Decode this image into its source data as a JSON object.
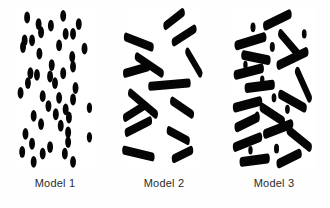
{
  "figure": {
    "background_color": "#fefefe",
    "panel_background_color": "#ffffff",
    "shape_color": "#050505",
    "label_color": "#2b2b2b"
  },
  "panels": [
    {
      "id": "model-1",
      "label": "Model 1",
      "shape_type": "circle",
      "description": "Randomly dispersed spherical particles (dots)"
    },
    {
      "id": "model-2",
      "label": "Model 2",
      "shape_type": "rod",
      "description": "Randomly oriented elongated rods, sparse"
    },
    {
      "id": "model-3",
      "label": "Model 3",
      "shape_type": "rod-and-circle",
      "description": "Dense mixture of rods and small particles"
    }
  ],
  "chart_data": {
    "type": "scatter",
    "title": "",
    "xlabel": "",
    "ylabel": "",
    "panel_width": 100,
    "panel_height": 100,
    "panel_1_circles": [
      {
        "cx": 16,
        "cy": 7,
        "r": 3.6
      },
      {
        "cx": 60,
        "cy": 6,
        "r": 3.6
      },
      {
        "cx": 30,
        "cy": 11,
        "r": 3.6
      },
      {
        "cx": 45,
        "cy": 12,
        "r": 3.6
      },
      {
        "cx": 79,
        "cy": 11,
        "r": 3.6
      },
      {
        "cx": 33,
        "cy": 16,
        "r": 3.6
      },
      {
        "cx": 63,
        "cy": 17,
        "r": 3.6
      },
      {
        "cx": 72,
        "cy": 17,
        "r": 3.6
      },
      {
        "cx": 13,
        "cy": 21,
        "r": 3.6
      },
      {
        "cx": 22,
        "cy": 21,
        "r": 3.6
      },
      {
        "cx": 55,
        "cy": 24,
        "r": 3.6
      },
      {
        "cx": 11,
        "cy": 25,
        "r": 3.6
      },
      {
        "cx": 31,
        "cy": 29,
        "r": 3.6
      },
      {
        "cx": 86,
        "cy": 26,
        "r": 3.6
      },
      {
        "cx": 71,
        "cy": 31,
        "r": 3.6
      },
      {
        "cx": 72,
        "cy": 37,
        "r": 3.6
      },
      {
        "cx": 46,
        "cy": 36,
        "r": 3.6
      },
      {
        "cx": 20,
        "cy": 41,
        "r": 3.6
      },
      {
        "cx": 28,
        "cy": 42,
        "r": 3.6
      },
      {
        "cx": 44,
        "cy": 43,
        "r": 3.6
      },
      {
        "cx": 60,
        "cy": 41,
        "r": 3.6
      },
      {
        "cx": 17,
        "cy": 47,
        "r": 3.6
      },
      {
        "cx": 50,
        "cy": 47,
        "r": 3.6
      },
      {
        "cx": 8,
        "cy": 53,
        "r": 3.6
      },
      {
        "cx": 75,
        "cy": 50,
        "r": 3.6
      },
      {
        "cx": 35,
        "cy": 55,
        "r": 3.6
      },
      {
        "cx": 55,
        "cy": 56,
        "r": 3.6
      },
      {
        "cx": 72,
        "cy": 57,
        "r": 3.6
      },
      {
        "cx": 42,
        "cy": 61,
        "r": 3.6
      },
      {
        "cx": 63,
        "cy": 63,
        "r": 3.6
      },
      {
        "cx": 92,
        "cy": 62,
        "r": 3.2
      },
      {
        "cx": 24,
        "cy": 67,
        "r": 3.6
      },
      {
        "cx": 51,
        "cy": 66,
        "r": 3.6
      },
      {
        "cx": 67,
        "cy": 68,
        "r": 3.6
      },
      {
        "cx": 33,
        "cy": 72,
        "r": 3.6
      },
      {
        "cx": 57,
        "cy": 73,
        "r": 3.6
      },
      {
        "cx": 14,
        "cy": 78,
        "r": 3.6
      },
      {
        "cx": 66,
        "cy": 77,
        "r": 3.6
      },
      {
        "cx": 66,
        "cy": 83,
        "r": 3.6
      },
      {
        "cx": 92,
        "cy": 80,
        "r": 3.2
      },
      {
        "cx": 22,
        "cy": 84,
        "r": 3.6
      },
      {
        "cx": 44,
        "cy": 86,
        "r": 3.6
      },
      {
        "cx": 10,
        "cy": 89,
        "r": 3.6
      },
      {
        "cx": 35,
        "cy": 90,
        "r": 3.6
      },
      {
        "cx": 62,
        "cy": 90,
        "r": 3.6
      },
      {
        "cx": 24,
        "cy": 95,
        "r": 3.6
      },
      {
        "cx": 72,
        "cy": 95,
        "r": 3.6
      }
    ],
    "panel_2_rods": [
      {
        "x1": 52,
        "y1": 12,
        "x2": 72,
        "y2": 4,
        "w": 5.5
      },
      {
        "x1": 5,
        "y1": 19,
        "x2": 35,
        "y2": 25,
        "w": 5.5
      },
      {
        "x1": 62,
        "y1": 22,
        "x2": 86,
        "y2": 14,
        "w": 5.5
      },
      {
        "x1": 18,
        "y1": 31,
        "x2": 47,
        "y2": 41,
        "w": 5.5
      },
      {
        "x1": 78,
        "y1": 28,
        "x2": 93,
        "y2": 41,
        "w": 5.5
      },
      {
        "x1": 4,
        "y1": 41,
        "x2": 31,
        "y2": 37,
        "w": 5.5
      },
      {
        "x1": 10,
        "y1": 53,
        "x2": 40,
        "y2": 66,
        "w": 5.5
      },
      {
        "x1": 34,
        "y1": 49,
        "x2": 79,
        "y2": 47,
        "w": 5.5
      },
      {
        "x1": 60,
        "y1": 58,
        "x2": 83,
        "y2": 66,
        "w": 5.5
      },
      {
        "x1": 4,
        "y1": 68,
        "x2": 26,
        "y2": 61,
        "w": 5.5
      },
      {
        "x1": 6,
        "y1": 77,
        "x2": 33,
        "y2": 70,
        "w": 5.5
      },
      {
        "x1": 56,
        "y1": 76,
        "x2": 78,
        "y2": 82,
        "w": 5.5
      },
      {
        "x1": 3,
        "y1": 88,
        "x2": 36,
        "y2": 92,
        "w": 5.5
      },
      {
        "x1": 62,
        "y1": 93,
        "x2": 82,
        "y2": 88,
        "w": 5.5
      }
    ],
    "panel_3_rods": [
      {
        "x1": 40,
        "y1": 12,
        "x2": 68,
        "y2": 5,
        "w": 6
      },
      {
        "x1": 6,
        "y1": 24,
        "x2": 38,
        "y2": 19,
        "w": 6
      },
      {
        "x1": 58,
        "y1": 17,
        "x2": 78,
        "y2": 29,
        "w": 6
      },
      {
        "x1": 14,
        "y1": 30,
        "x2": 43,
        "y2": 33,
        "w": 6
      },
      {
        "x1": 56,
        "y1": 36,
        "x2": 88,
        "y2": 28,
        "w": 6
      },
      {
        "x1": 5,
        "y1": 42,
        "x2": 35,
        "y2": 38,
        "w": 6
      },
      {
        "x1": 78,
        "y1": 40,
        "x2": 92,
        "y2": 56,
        "w": 6
      },
      {
        "x1": 18,
        "y1": 50,
        "x2": 48,
        "y2": 48,
        "w": 6
      },
      {
        "x1": 58,
        "y1": 54,
        "x2": 86,
        "y2": 62,
        "w": 6
      },
      {
        "x1": 4,
        "y1": 62,
        "x2": 33,
        "y2": 58,
        "w": 6
      },
      {
        "x1": 36,
        "y1": 62,
        "x2": 60,
        "y2": 70,
        "w": 6
      },
      {
        "x1": 6,
        "y1": 74,
        "x2": 30,
        "y2": 68,
        "w": 6
      },
      {
        "x1": 40,
        "y1": 78,
        "x2": 70,
        "y2": 72,
        "w": 6
      },
      {
        "x1": 68,
        "y1": 76,
        "x2": 92,
        "y2": 86,
        "w": 6
      },
      {
        "x1": 4,
        "y1": 86,
        "x2": 33,
        "y2": 80,
        "w": 6
      },
      {
        "x1": 12,
        "y1": 95,
        "x2": 42,
        "y2": 93,
        "w": 6
      },
      {
        "x1": 56,
        "y1": 96,
        "x2": 80,
        "y2": 90,
        "w": 6
      }
    ],
    "panel_3_circles": [
      {
        "cx": 25,
        "cy": 13,
        "r": 3.0
      },
      {
        "cx": 16,
        "cy": 36,
        "r": 2.6
      },
      {
        "cx": 48,
        "cy": 25,
        "r": 3.0
      },
      {
        "cx": 86,
        "cy": 17,
        "r": 2.8
      },
      {
        "cx": 36,
        "cy": 45,
        "r": 2.6
      },
      {
        "cx": 50,
        "cy": 56,
        "r": 2.8
      },
      {
        "cx": 30,
        "cy": 67,
        "r": 2.6
      },
      {
        "cx": 66,
        "cy": 63,
        "r": 2.8
      },
      {
        "cx": 22,
        "cy": 88,
        "r": 2.6
      },
      {
        "cx": 53,
        "cy": 87,
        "r": 3.0
      }
    ]
  }
}
